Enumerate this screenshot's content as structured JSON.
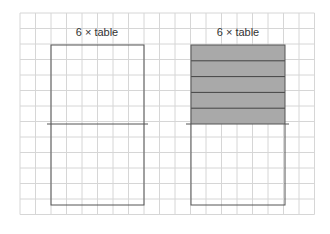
{
  "diagram": {
    "grid": {
      "x0": 20,
      "y0": 13,
      "cols": 19,
      "rows": 13,
      "cell": 15.5,
      "color": "#d6d6d6"
    },
    "left": {
      "label": "6 × table",
      "shaded_rows": 0
    },
    "right": {
      "label": "6 × table",
      "shaded_rows": 5,
      "shade_color": "#a9a9a9"
    },
    "rect_color": "#555555"
  }
}
